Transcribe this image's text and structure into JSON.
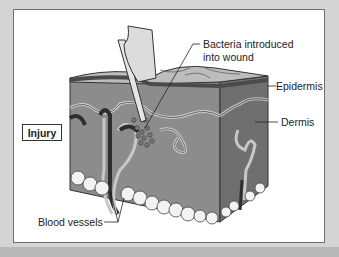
{
  "diagram": {
    "labels": {
      "bacteria_line1": "Bacteria introduced",
      "bacteria_line2": "into wound",
      "epidermis": "Epidermis",
      "dermis": "Dermis",
      "injury": "Injury",
      "blood_vessels": "Blood vessels"
    },
    "colors": {
      "background": "#d4d4d4",
      "frame": "#ffffff",
      "dermis_front": "#8c8c8c",
      "dermis_side": "#6f6f6f",
      "epidermis_top": "#bdbdbd",
      "epidermis_band": "#4a4a4a",
      "fat_cells": "#f2f2f2",
      "vessel_dark": "#2e2e2e",
      "vessel_light": "#c8c8c8"
    }
  }
}
